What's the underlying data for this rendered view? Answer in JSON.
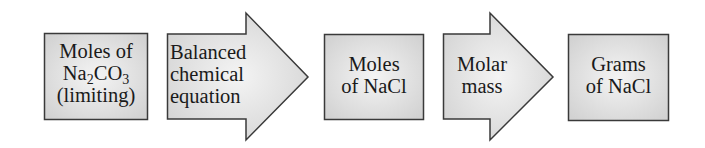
{
  "diagram": {
    "type": "flowchart",
    "direction": "left-to-right",
    "steps": [
      {
        "shape": "box",
        "lines": [
          "Moles of",
          "Na2CO3",
          "(limiting)"
        ],
        "line1": "Moles of",
        "formula": {
          "a": "Na",
          "a_sub": "2",
          "b": "CO",
          "b_sub": "3"
        },
        "line3": "(limiting)"
      },
      {
        "shape": "arrow",
        "lines": [
          "Balanced",
          "chemical",
          "equation"
        ]
      },
      {
        "shape": "box",
        "lines": [
          "Moles",
          "of NaCl"
        ]
      },
      {
        "shape": "arrow",
        "lines": [
          "Molar",
          "mass"
        ]
      },
      {
        "shape": "box",
        "lines": [
          "Grams",
          "of NaCl"
        ]
      }
    ],
    "colors": {
      "fill_edge": "#d4d4d4",
      "fill_center": "#f2f2f2",
      "stroke": "#3a3a3a",
      "text": "#1a1a1a"
    }
  }
}
